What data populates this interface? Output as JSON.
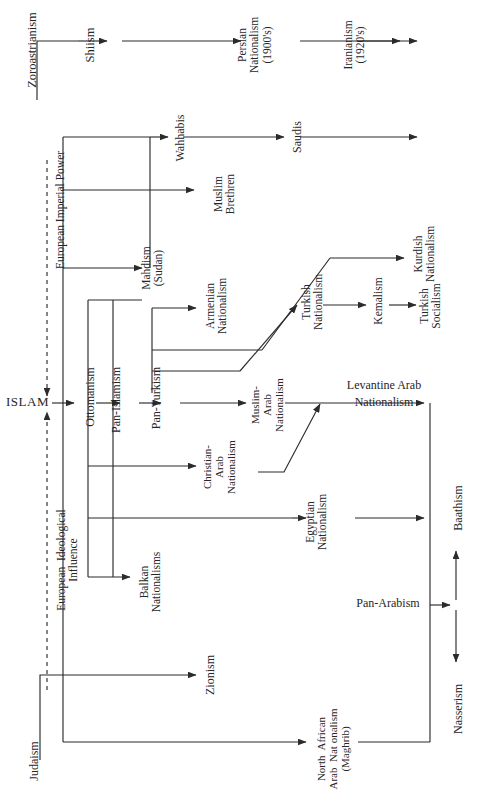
{
  "diagram": {
    "type": "flow-genealogy",
    "orientation": "rotated-90-ccw",
    "background": "#ffffff",
    "line_color": "#2b2b2b",
    "nodes": {
      "zoroastrianism": "Zoroastrianism",
      "shiism": "Shiism",
      "persian_nationalism": "Persian\nNationalism\n(1900's)",
      "iranianism": "Iranianism\n(1920's)",
      "islam": "ISLAM",
      "judaism": "Judaism",
      "european_imperial_power": "European Imperial Power",
      "european_ideological_influence": "European  Ideological\nInfluence",
      "wahhabis": "Wahhabis",
      "saudis": "Saudis",
      "muslim_brethren": "Muslim\nBrethren",
      "mahdism": "Mahdism\n(Sudan)",
      "ottomanism": "Ottomanism",
      "pan_islamism": "Pan-Islamism",
      "pan_turkism": "Pan-Turkism",
      "armenian_nationalism": "Armenian\nNationalism",
      "turkish_nationalism": "Turkish\nNationalism",
      "kemalism": "Kemalism",
      "turkish_socialism": "Turkish\nSocialism",
      "kurdish_nationalism": "Kurdish\nNationalism",
      "muslim_arab_nationalism": "Muslim-\nArab\nNationalism",
      "christian_arab_nationalism": "Christian-\nArab\nNationalism",
      "egyptian_nationalism": "Egyptian\nNationalism",
      "balkan_nationalisms": "Balkan\nNationalisms",
      "zionism": "Zionism",
      "north_african": "North  African\nArab  Nat onalism\n(Maghrib)",
      "levantine_arab_nationalism_l1": "Levantine Arab",
      "levantine_arab_nationalism_l2": "Nationalism",
      "pan_arabism": "Pan-Arabism",
      "baathism": "Baathism",
      "nasserism": "Nasserism"
    },
    "edges": [
      {
        "from": "zoroastrianism",
        "to": "shiism"
      },
      {
        "from": "shiism",
        "to": "persian_nationalism"
      },
      {
        "from": "persian_nationalism",
        "to": "iranianism"
      },
      {
        "from": "iranianism",
        "to": "(open)"
      },
      {
        "from": "islam",
        "to": "shiism"
      },
      {
        "from": "islam",
        "to": "wahhabis"
      },
      {
        "from": "wahhabis",
        "to": "saudis"
      },
      {
        "from": "saudis",
        "to": "(open)"
      },
      {
        "from": "islam",
        "to": "muslim_brethren"
      },
      {
        "from": "islam",
        "to": "mahdism"
      },
      {
        "from": "islam",
        "to": "ottomanism"
      },
      {
        "from": "ottomanism",
        "to": "pan_islamism"
      },
      {
        "from": "pan_islamism",
        "to": "pan_turkism"
      },
      {
        "from": "pan_turkism",
        "to": "armenian_nationalism"
      },
      {
        "from": "pan_turkism",
        "to": "kurdish_nationalism"
      },
      {
        "from": "pan_turkism",
        "to": "turkish_nationalism"
      },
      {
        "from": "turkish_nationalism",
        "to": "kemalism"
      },
      {
        "from": "kemalism",
        "to": "turkish_socialism"
      },
      {
        "from": "pan_turkism",
        "to": "muslim_arab_nationalism"
      },
      {
        "from": "muslim_arab_nationalism",
        "to": "levantine_arab_nationalism_l1"
      },
      {
        "from": "christian_arab_nationalism",
        "to": "levantine_arab_nationalism_l1"
      },
      {
        "from": "ottomanism",
        "to": "christian_arab_nationalism"
      },
      {
        "from": "ottomanism",
        "to": "egyptian_nationalism"
      },
      {
        "from": "ottomanism",
        "to": "balkan_nationalisms"
      },
      {
        "from": "judaism",
        "to": "zionism"
      },
      {
        "from": "judaism",
        "to": "north_african"
      },
      {
        "from": "levantine_arab_nationalism_l1",
        "to": "pan_arabism"
      },
      {
        "from": "egyptian_nationalism",
        "to": "pan_arabism"
      },
      {
        "from": "north_african",
        "to": "pan_arabism"
      },
      {
        "from": "pan_arabism",
        "to": "baathism"
      },
      {
        "from": "pan_arabism",
        "to": "nasserism"
      },
      {
        "from": "european_imperial_power",
        "to": "islam",
        "style": "dashed"
      },
      {
        "from": "european_ideological_influence",
        "to": "islam",
        "style": "dashed"
      }
    ]
  }
}
